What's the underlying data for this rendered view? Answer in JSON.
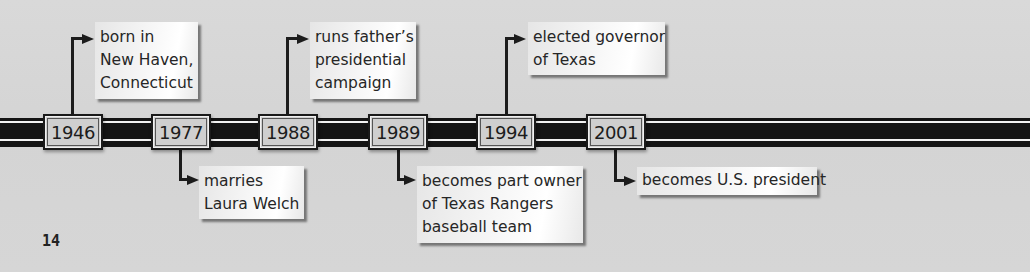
{
  "timeline": {
    "events": [
      {
        "year": "1946",
        "position": "above",
        "lines": [
          "born in",
          "New Haven,",
          "Connecticut"
        ]
      },
      {
        "year": "1977",
        "position": "below",
        "lines": [
          "marries",
          "Laura Welch"
        ]
      },
      {
        "year": "1988",
        "position": "above",
        "lines": [
          "runs father’s",
          "presidential",
          "campaign"
        ]
      },
      {
        "year": "1989",
        "position": "below",
        "lines": [
          "becomes part owner",
          "of Texas Rangers",
          "baseball team"
        ]
      },
      {
        "year": "1994",
        "position": "above",
        "lines": [
          "elected governor",
          "of Texas"
        ]
      },
      {
        "year": "2001",
        "position": "below",
        "lines": [
          "becomes U.S. president"
        ]
      }
    ]
  },
  "page": {
    "number": "14"
  },
  "colors": {
    "background": "#d6d6d6",
    "bar": "#141414",
    "stripe": "#f2f2f2",
    "year_box_fill": "#cfcfcf",
    "callout_fill": "#f5f5f5"
  }
}
